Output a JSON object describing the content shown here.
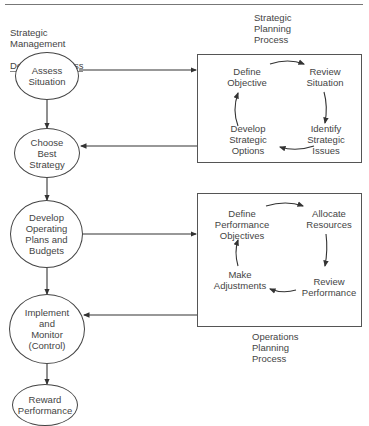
{
  "titles": {
    "left": "Strategic\nManagement",
    "left_underlined": "Decision Process",
    "right_top": "Strategic\nPlanning\nProcess",
    "right_bottom": "Operations\nPlanning\nProcess"
  },
  "decision_process": [
    {
      "label": "Assess\nSituation"
    },
    {
      "label": "Choose\nBest\nStrategy"
    },
    {
      "label": "Develop\nOperating\nPlans and\nBudgets"
    },
    {
      "label": "Implement\nand\nMonitor\n(Control)"
    },
    {
      "label": "Reward\nPerformance"
    }
  ],
  "strategic_planning_cycle": [
    {
      "label": "Define\nObjective"
    },
    {
      "label": "Review\nSituation"
    },
    {
      "label": "Identify\nStrategic\nIssues"
    },
    {
      "label": "Develop\nStrategic\nOptions"
    }
  ],
  "operations_planning_cycle": [
    {
      "label": "Define\nPerformance\nObjectives"
    },
    {
      "label": "Allocate\nResources"
    },
    {
      "label": "Review\nPerformance"
    },
    {
      "label": "Make\nAdjustments"
    }
  ]
}
